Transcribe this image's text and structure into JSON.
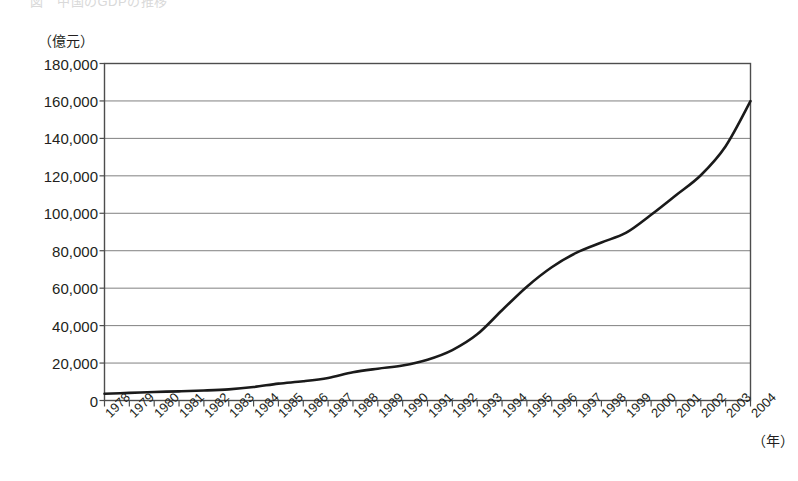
{
  "figure": {
    "cut_off_header": "図　中国のGDPの推移",
    "y_unit_label": "（億元）",
    "x_unit_label": "（年）"
  },
  "chart_data": {
    "type": "line",
    "title": "",
    "subtitle": "",
    "xlabel": "（年）",
    "ylabel": "（億元）",
    "ylim": [
      0,
      180000
    ],
    "ytick_step": 20000,
    "ytick_labels": [
      "0",
      "20,000",
      "40,000",
      "60,000",
      "80,000",
      "100,000",
      "120,000",
      "140,000",
      "160,000",
      "180,000"
    ],
    "ytick_values": [
      0,
      20000,
      40000,
      60000,
      80000,
      100000,
      120000,
      140000,
      160000,
      180000
    ],
    "grid": true,
    "grid_axis": "y",
    "legend": "none",
    "line_color": "#1a1a1a",
    "line_width_px": 2.6,
    "categories": [
      "1978",
      "1979",
      "1980",
      "1981",
      "1982",
      "1983",
      "1984",
      "1985",
      "1986",
      "1987",
      "1988",
      "1989",
      "1990",
      "1991",
      "1992",
      "1993",
      "1994",
      "1995",
      "1996",
      "1997",
      "1998",
      "1999",
      "2000",
      "2001",
      "2002",
      "2003",
      "2004"
    ],
    "x": [
      1978,
      1979,
      1980,
      1981,
      1982,
      1983,
      1984,
      1985,
      1986,
      1987,
      1988,
      1989,
      1990,
      1991,
      1992,
      1993,
      1994,
      1995,
      1996,
      1997,
      1998,
      1999,
      2000,
      2001,
      2002,
      2003,
      2004
    ],
    "series": [
      {
        "name": "GDP",
        "values": [
          3645,
          4063,
          4546,
          4892,
          5323,
          5963,
          7208,
          9016,
          10275,
          12059,
          15043,
          16992,
          18668,
          21782,
          26923,
          35334,
          48198,
          60794,
          71177,
          78973,
          84402,
          89677,
          99215,
          109655,
          120333,
          135823,
          159878
        ]
      }
    ]
  }
}
